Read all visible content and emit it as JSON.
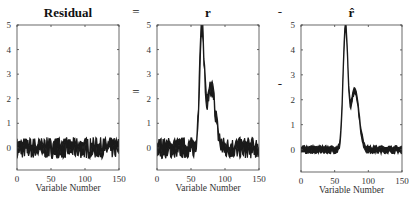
{
  "equation": {
    "operators": [
      "=",
      "-"
    ]
  },
  "chart_data": [
    {
      "type": "line",
      "title": "Residual",
      "xlabel": "Variable Number",
      "ylabel": "",
      "xlim": [
        0,
        150
      ],
      "ylim": [
        -0.9,
        5
      ],
      "xticks": [
        0,
        50,
        100,
        150
      ],
      "yticks": [
        0,
        1,
        2,
        3,
        4,
        5
      ],
      "description": "Noise around 0, roughly between -0.8 and 0.8 across all 150 variables",
      "profile": {
        "baseline": 0,
        "noise": 0.35,
        "peaks": []
      }
    },
    {
      "type": "line",
      "title": "r",
      "xlabel": "Variable Number",
      "ylabel": "",
      "xlim": [
        0,
        150
      ],
      "ylim": [
        -0.9,
        5
      ],
      "xticks": [
        0,
        50,
        100,
        150
      ],
      "yticks": [
        0,
        1,
        2,
        3,
        4,
        5
      ],
      "description": "Noisy signal with sharp peak (~5) near variable 65, shoulder ~2.5 near 80, returns to ~0 by 90",
      "profile": {
        "baseline": 0,
        "noise": 0.35,
        "peaks": [
          [
            66,
            4.8,
            3.5
          ],
          [
            80,
            2.4,
            6
          ]
        ]
      }
    },
    {
      "type": "line",
      "title": "r̂",
      "xlabel": "Variable Number",
      "ylabel": "",
      "xlim": [
        0,
        150
      ],
      "ylim": [
        -0.9,
        5
      ],
      "xticks": [
        0,
        50,
        100,
        150
      ],
      "yticks": [
        0,
        1,
        2,
        3,
        4,
        5
      ],
      "description": "Smooth estimate: flat ~0 with small noise, sharp peak (~5) near variable 65, shoulder ~2.5 near 80",
      "profile": {
        "baseline": 0,
        "noise": 0.08,
        "peaks": [
          [
            66,
            4.8,
            3.5
          ],
          [
            80,
            2.4,
            6
          ]
        ]
      }
    }
  ]
}
